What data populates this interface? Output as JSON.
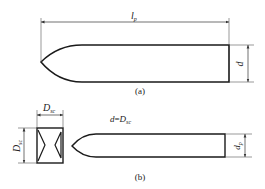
{
  "figure_a": {
    "caption": "(a)",
    "length_label": "l",
    "length_sub": "p",
    "diameter_label": "d"
  },
  "figure_b": {
    "caption": "(b)",
    "box_width_label": "D",
    "box_width_sub": "sc",
    "box_height_label": "D",
    "box_height_sub": "sc",
    "equation_lhs": "d",
    "equation_eq": "=",
    "equation_rhs": "D",
    "equation_rhs_sub": "sc",
    "diameter_label": "d",
    "diameter_sub": "p"
  },
  "colors": {
    "line": "#1a1a1a",
    "thin_line": "#555555",
    "background": "#ffffff"
  }
}
